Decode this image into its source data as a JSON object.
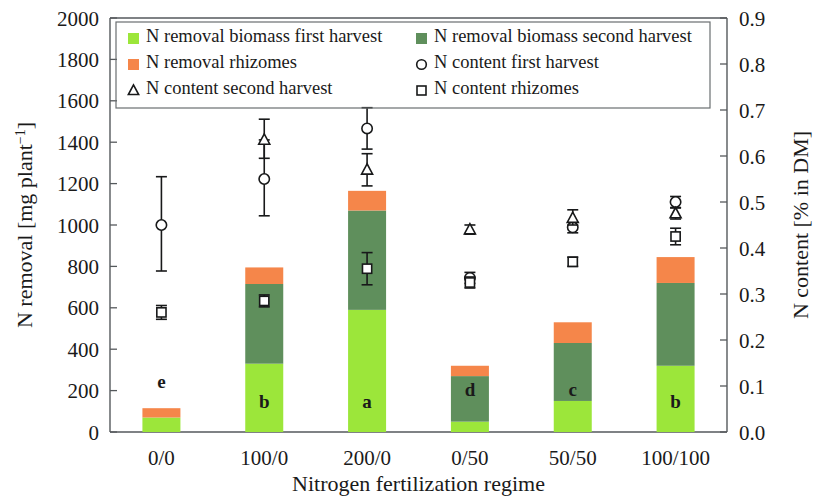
{
  "chart_data": {
    "type": "bar",
    "subtype": "stacked-bar-with-overlaid-scatter-errorbars",
    "title": "",
    "xlabel": "Nitrogen fertilization regime",
    "ylabel": "N removal [mg plant⁻¹]",
    "y2label": "N content [% in DM]",
    "categories": [
      "0/0",
      "100/0",
      "200/0",
      "0/50",
      "50/50",
      "100/100"
    ],
    "ylim": [
      0,
      2000
    ],
    "yticks": [
      0,
      200,
      400,
      600,
      800,
      1000,
      1200,
      1400,
      1600,
      1800,
      2000
    ],
    "ytick_labels": [
      "0",
      "200",
      "400",
      "600",
      "800",
      "1000",
      "1200",
      "1400",
      "1600",
      "1800",
      "2000"
    ],
    "y2lim": [
      0.0,
      0.9
    ],
    "y2ticks": [
      0.0,
      0.1,
      0.2,
      0.3,
      0.4,
      0.5,
      0.6,
      0.7,
      0.8,
      0.9
    ],
    "y2tick_labels": [
      "0.0",
      "0.1",
      "0.2",
      "0.3",
      "0.4",
      "0.5",
      "0.6",
      "0.7",
      "0.8",
      "0.9"
    ],
    "grid": false,
    "legend_position": "upper-left-inside",
    "series": [
      {
        "name": "N removal biomass first harvest",
        "kind": "bar-segment",
        "color": "#9ce63a",
        "axis": "left",
        "values": [
          70,
          330,
          590,
          50,
          150,
          320
        ]
      },
      {
        "name": "N removal biomass second harvest",
        "kind": "bar-segment",
        "color": "#5f8f5c",
        "axis": "left",
        "values": [
          0,
          385,
          480,
          220,
          280,
          400
        ]
      },
      {
        "name": "N removal rhizomes",
        "kind": "bar-segment",
        "color": "#f5864a",
        "axis": "left",
        "values": [
          45,
          80,
          95,
          50,
          100,
          125
        ]
      },
      {
        "name": "N content first harvest",
        "kind": "marker",
        "marker": "circle-open",
        "axis": "right",
        "values": [
          0.45,
          0.55,
          0.66,
          0.335,
          0.445,
          0.5
        ],
        "err_lower": [
          0.1,
          0.08,
          0.045,
          0.012,
          0.012,
          0.012
        ],
        "err_upper": [
          0.105,
          0.085,
          0.045,
          0.012,
          0.012,
          0.012
        ]
      },
      {
        "name": "N content second harvest",
        "kind": "marker",
        "marker": "triangle-open",
        "axis": "right",
        "values": [
          null,
          0.635,
          0.57,
          0.44,
          0.465,
          0.475
        ],
        "err_lower": [
          null,
          0.04,
          0.035,
          0.01,
          0.015,
          0.012
        ],
        "err_upper": [
          null,
          0.045,
          0.035,
          0.01,
          0.018,
          0.012
        ]
      },
      {
        "name": "N content rhizomes",
        "kind": "marker",
        "marker": "square-open",
        "axis": "right",
        "values": [
          0.26,
          0.285,
          0.355,
          0.325,
          0.37,
          0.425
        ],
        "err_lower": [
          0.015,
          0.013,
          0.035,
          0.012,
          0.01,
          0.018
        ],
        "err_upper": [
          0.015,
          0.013,
          0.035,
          0.012,
          0.01,
          0.018
        ]
      }
    ],
    "significance_letters": [
      "e",
      "b",
      "a",
      "d",
      "c",
      "b"
    ],
    "bar_totals": [
      115,
      795,
      1165,
      320,
      530,
      845
    ],
    "annotations": []
  },
  "legend": {
    "entries": [
      {
        "label": "N removal biomass first harvest",
        "symbol": "square-filled",
        "color": "#9ce63a"
      },
      {
        "label": "N removal biomass second harvest",
        "symbol": "square-filled",
        "color": "#5f8f5c"
      },
      {
        "label": "N removal rhizomes",
        "symbol": "square-filled",
        "color": "#f5864a"
      },
      {
        "label": "N content first harvest",
        "symbol": "circle-open",
        "color": "#18191a"
      },
      {
        "label": "N content second harvest",
        "symbol": "triangle-open",
        "color": "#18191a"
      },
      {
        "label": "N content rhizomes",
        "symbol": "square-open",
        "color": "#18191a"
      }
    ]
  },
  "axes": {
    "left_title_main": "N removal [mg plant",
    "left_title_sup": "−1",
    "left_title_tail": "]",
    "right_title": "N content [% in DM]",
    "x_title": "Nitrogen fertilization regime"
  },
  "colors": {
    "first_harvest": "#9ce63a",
    "second_harvest": "#5f8f5c",
    "rhizomes": "#f5864a",
    "marker_stroke": "#18191a",
    "axis": "#55595c",
    "background": "#ffffff"
  }
}
